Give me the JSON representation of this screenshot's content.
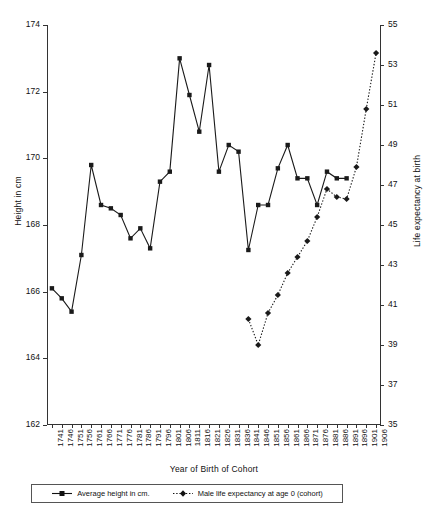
{
  "chart_data": {
    "type": "line",
    "title": "",
    "xlabel": "Year of Birth of Cohort",
    "ylabel": "Height in cm",
    "ylabel_right": "Life expectancy at birth",
    "ylim": [
      162,
      174
    ],
    "ylim_right": [
      35,
      55
    ],
    "ytick_step": 2,
    "ytick_step_right": 2,
    "grid": false,
    "legend_position": "bottom",
    "yticks": [
      162,
      164,
      166,
      168,
      170,
      172,
      174
    ],
    "yticks_right": [
      35,
      37,
      39,
      41,
      43,
      45,
      47,
      49,
      51,
      53,
      55
    ],
    "categories": [
      "1741",
      "1746",
      "1751",
      "1756",
      "1761",
      "1766",
      "1771",
      "1776",
      "1781",
      "1786",
      "1791",
      "1796",
      "1801",
      "1806",
      "1811",
      "1816",
      "1821",
      "1826",
      "1831",
      "1836",
      "1841",
      "1846",
      "1851",
      "1856",
      "1861",
      "1866",
      "1871",
      "1876",
      "1881",
      "1886",
      "1891",
      "1896",
      "1901",
      "1906"
    ],
    "series": [
      {
        "name": "Average height in cm.",
        "axis": "left",
        "line_style": "solid",
        "marker": "square",
        "color": "#1a1a1a",
        "values": [
          166.1,
          165.8,
          165.4,
          167.1,
          169.8,
          168.6,
          168.5,
          168.3,
          167.6,
          167.9,
          167.3,
          169.3,
          169.6,
          173.0,
          171.9,
          170.8,
          172.8,
          169.6,
          170.4,
          170.2,
          167.25,
          168.6,
          168.6,
          169.7,
          170.4,
          169.4,
          169.4,
          168.6,
          169.6,
          169.4,
          169.4,
          null,
          null,
          null
        ]
      },
      {
        "name": "Male life expectancy at age 0 (cohort)",
        "axis": "right",
        "line_style": "dotted",
        "marker": "diamond",
        "color": "#1a1a1a",
        "values": [
          null,
          null,
          null,
          null,
          null,
          null,
          null,
          null,
          null,
          null,
          null,
          null,
          null,
          null,
          null,
          null,
          null,
          null,
          null,
          null,
          40.3,
          39.0,
          40.6,
          41.5,
          42.6,
          43.4,
          44.2,
          45.4,
          46.8,
          46.4,
          46.3,
          47.9,
          50.8,
          53.6
        ]
      }
    ]
  },
  "legend": {
    "items": [
      {
        "label": "Average height in cm.",
        "marker": "square",
        "line": "solid"
      },
      {
        "label": "Male life expectancy at age 0 (cohort)",
        "marker": "diamond",
        "line": "dotted"
      }
    ]
  }
}
